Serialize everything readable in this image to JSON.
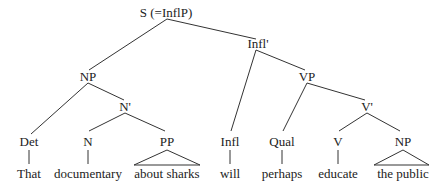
{
  "diagram": {
    "type": "syntax-tree",
    "colors": {
      "line": "#333333",
      "text": "#222222",
      "background": "#ffffff"
    },
    "nodes": {
      "s": "S (=InflP)",
      "infl_bar": "Infl'",
      "np_subject": "NP",
      "vp": "VP",
      "n_bar": "N'",
      "v_bar": "V'",
      "det": "Det",
      "n": "N",
      "pp": "PP",
      "infl": "Infl",
      "qual": "Qual",
      "v": "V",
      "np_object": "NP"
    },
    "words": {
      "det": "That",
      "n": "documentary",
      "pp": "about sharks",
      "infl": "will",
      "qual": "perhaps",
      "v": "educate",
      "np_object": "the public"
    }
  }
}
